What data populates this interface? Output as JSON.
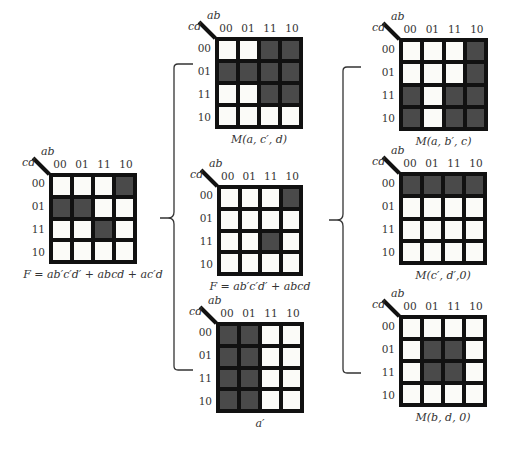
{
  "header_labels": {
    "cols_var": "ab",
    "rows_var": "cd"
  },
  "col_labels": [
    "00",
    "01",
    "11",
    "10"
  ],
  "row_labels": [
    "00",
    "01",
    "11",
    "10"
  ],
  "maps": [
    {
      "id": "left",
      "caption": "F = ab′c′d′ + abcd + ac′d",
      "cells": [
        [
          0,
          0,
          0,
          1
        ],
        [
          1,
          1,
          0,
          0
        ],
        [
          0,
          0,
          1,
          0
        ],
        [
          0,
          0,
          0,
          0
        ]
      ]
    },
    {
      "id": "mid-top",
      "caption": "M(a, c′, d)",
      "cells": [
        [
          0,
          0,
          1,
          1
        ],
        [
          1,
          1,
          1,
          1
        ],
        [
          0,
          0,
          1,
          1
        ],
        [
          0,
          0,
          0,
          0
        ]
      ]
    },
    {
      "id": "mid-center",
      "caption": "F = ab′c′d′ + abcd",
      "cells": [
        [
          0,
          0,
          0,
          1
        ],
        [
          0,
          0,
          0,
          0
        ],
        [
          0,
          0,
          1,
          0
        ],
        [
          0,
          0,
          0,
          0
        ]
      ]
    },
    {
      "id": "mid-bottom",
      "caption": "a′",
      "cells": [
        [
          1,
          1,
          0,
          0
        ],
        [
          1,
          1,
          0,
          0
        ],
        [
          1,
          1,
          0,
          0
        ],
        [
          1,
          1,
          0,
          0
        ]
      ]
    },
    {
      "id": "right-top",
      "caption": "M(a, b′, c)",
      "cells": [
        [
          0,
          0,
          0,
          1
        ],
        [
          0,
          0,
          0,
          1
        ],
        [
          1,
          0,
          1,
          1
        ],
        [
          1,
          0,
          1,
          1
        ]
      ]
    },
    {
      "id": "right-center",
      "caption": "M(c′, d′,0)",
      "cells": [
        [
          1,
          1,
          1,
          1
        ],
        [
          0,
          0,
          0,
          0
        ],
        [
          0,
          0,
          0,
          0
        ],
        [
          0,
          0,
          0,
          0
        ]
      ]
    },
    {
      "id": "right-bottom",
      "caption": "M(b, d, 0)",
      "cells": [
        [
          0,
          0,
          0,
          0
        ],
        [
          0,
          1,
          1,
          0
        ],
        [
          0,
          1,
          1,
          0
        ],
        [
          0,
          0,
          0,
          0
        ]
      ]
    }
  ],
  "colors": {
    "filled": "#4a4a4a",
    "empty": "#fbfbf8",
    "border": "#111111"
  }
}
